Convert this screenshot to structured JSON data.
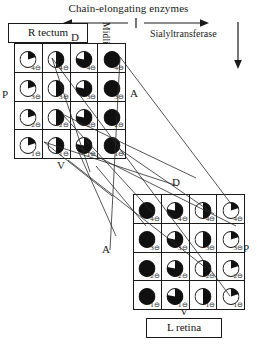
{
  "header": {
    "title": "Chain-elongating enzymes",
    "midline_label": "Midline",
    "sialyltransferase_label": "Sialyltransferase",
    "left_arrow_icon": "arrow-left-icon",
    "right_arrow_icon": "arrow-right-icon",
    "down_arrow_icon": "arrow-down-icon"
  },
  "tectum": {
    "box_label": "R tectum",
    "axis": {
      "dorsal": "D",
      "posterior": "P",
      "anterior": "A",
      "ventral": "V"
    },
    "rows": [
      {
        "row_label": "4",
        "cells": [
          {
            "label": "4",
            "symbol": "⊖",
            "fill": 0.2
          },
          {
            "label": "4",
            "symbol": "⊖",
            "fill": 0.5
          },
          {
            "label": "4",
            "symbol": "⊖",
            "fill": 0.78
          },
          {
            "label": "4",
            "symbol": "⊖",
            "fill": 1.0
          }
        ]
      },
      {
        "row_label": "3",
        "cells": [
          {
            "label": "3",
            "symbol": "⊖",
            "fill": 0.2
          },
          {
            "label": "3",
            "symbol": "⊖",
            "fill": 0.5
          },
          {
            "label": "3",
            "symbol": "⊖",
            "fill": 0.78
          },
          {
            "label": "3",
            "symbol": "⊖",
            "fill": 1.0
          }
        ]
      },
      {
        "row_label": "2",
        "cells": [
          {
            "label": "2",
            "symbol": "⊖",
            "fill": 0.2
          },
          {
            "label": "2",
            "symbol": "⊖",
            "fill": 0.5
          },
          {
            "label": "2",
            "symbol": "⊖",
            "fill": 0.78
          },
          {
            "label": "2",
            "symbol": "⊖",
            "fill": 1.0
          }
        ]
      },
      {
        "row_label": "1",
        "cells": [
          {
            "label": "1",
            "symbol": "⊖",
            "fill": 0.2
          },
          {
            "label": "1",
            "symbol": "⊖",
            "fill": 0.5
          },
          {
            "label": "1",
            "symbol": "⊖",
            "fill": 0.78
          },
          {
            "label": "1",
            "symbol": "⊖",
            "fill": 1.0
          }
        ]
      }
    ]
  },
  "retina": {
    "box_label": "L retina",
    "axis": {
      "dorsal": "D",
      "posterior": "P",
      "anterior": "A",
      "ventral": "V"
    },
    "rows": [
      {
        "row_label": "4",
        "cells": [
          {
            "label": "4",
            "symbol": "⊖",
            "fill": 1.0
          },
          {
            "label": "4",
            "symbol": "⊖",
            "fill": 0.78
          },
          {
            "label": "4",
            "symbol": "⊖",
            "fill": 0.5
          },
          {
            "label": "4",
            "symbol": "⊖",
            "fill": 0.2
          }
        ]
      },
      {
        "row_label": "3",
        "cells": [
          {
            "label": "3",
            "symbol": "⊖",
            "fill": 1.0
          },
          {
            "label": "3",
            "symbol": "⊖",
            "fill": 0.78
          },
          {
            "label": "3",
            "symbol": "⊖",
            "fill": 0.5
          },
          {
            "label": "3",
            "symbol": "⊖",
            "fill": 0.2
          }
        ]
      },
      {
        "row_label": "2",
        "cells": [
          {
            "label": "2",
            "symbol": "⊖",
            "fill": 1.0
          },
          {
            "label": "2",
            "symbol": "⊖",
            "fill": 0.78
          },
          {
            "label": "2",
            "symbol": "⊖",
            "fill": 0.5
          },
          {
            "label": "2",
            "symbol": "⊖",
            "fill": 0.2
          }
        ]
      },
      {
        "row_label": "1",
        "cells": [
          {
            "label": "1",
            "symbol": "⊖",
            "fill": 1.0
          },
          {
            "label": "1",
            "symbol": "⊖",
            "fill": 0.78
          },
          {
            "label": "1",
            "symbol": "⊖",
            "fill": 0.5
          },
          {
            "label": "1",
            "symbol": "⊖",
            "fill": 0.2
          }
        ]
      }
    ]
  },
  "colors": {
    "ink": "#1a1a1a",
    "background": "#ffffff",
    "disc_fill": "#101010"
  }
}
